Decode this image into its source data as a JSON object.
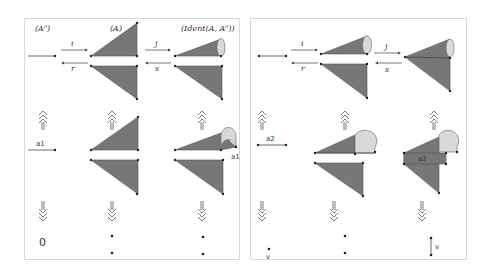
{
  "figure": {
    "left_panel": {
      "headers": [
        "(A⁰)",
        "(A)",
        "(Ident(A, A⁰))"
      ],
      "maps_top": {
        "forward_1": "i",
        "backward_1": "r",
        "forward_2": "j",
        "backward_2": "s"
      },
      "edge_label_row2_col1": "a1",
      "edge_label_row2_col3": "a1",
      "bottom_row": {
        "col1": "0",
        "col2": "• •",
        "col3": "• •"
      },
      "vertical_arrows": {
        "up": "up-triple-arrow",
        "down": "down-triple-arrow"
      }
    },
    "right_panel": {
      "maps_top": {
        "forward_1": "i",
        "backward_1": "r",
        "forward_2": "j",
        "backward_2": "s"
      },
      "edge_label_row2_col1": "a2",
      "edge_label_row2_col3": "a2",
      "bottom_row": {
        "col1": "v",
        "col2": "• •",
        "col3": "v"
      },
      "vertical_arrows": {
        "up": "up-triple-arrow",
        "down": "down-triple-arrow"
      }
    },
    "colors": {
      "triangle_fill": "#777777",
      "cap_fill": "#d9d9d9",
      "border": "#d8d8d8"
    }
  }
}
